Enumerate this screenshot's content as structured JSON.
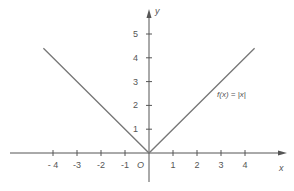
{
  "chart_data": {
    "type": "line",
    "title": "",
    "function_label": "f(x) = |x|",
    "xlabel": "x",
    "ylabel": "y",
    "origin_label": "O",
    "xlim": [
      -5.8,
      5.8
    ],
    "ylim": [
      -1.2,
      6
    ],
    "x_ticks": [
      -4,
      -3,
      -2,
      -1,
      1,
      2,
      3,
      4
    ],
    "x_tick_labels": [
      "- 4",
      "-3",
      "-2",
      "-1",
      "1",
      "2",
      "3",
      "4"
    ],
    "y_ticks": [
      1,
      2,
      3,
      4,
      5
    ],
    "y_tick_labels": [
      "1",
      "2",
      "3",
      "4",
      "5"
    ],
    "grid": false,
    "legend": "none",
    "series": [
      {
        "name": "f(x) = |x|",
        "x": [
          -4.4,
          0,
          4.4
        ],
        "y": [
          4.4,
          0,
          4.4
        ]
      }
    ],
    "colors": {
      "axis": "#555555",
      "curve": "#777777",
      "text": "#555555"
    }
  }
}
